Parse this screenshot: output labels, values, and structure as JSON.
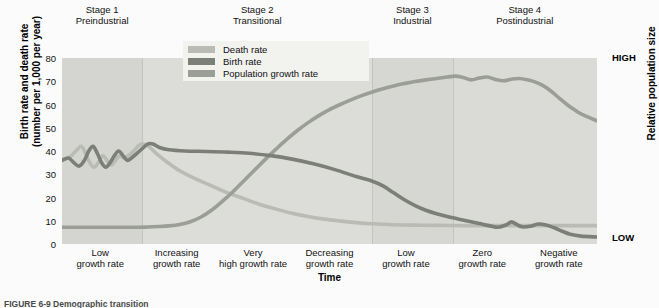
{
  "chart_data": {
    "type": "line",
    "xlabel": "Time",
    "ylabel_line1": "Birth rate and death rate",
    "ylabel_line2": "(number per 1,000 per year)",
    "right_axis_label": "Relative population size",
    "right_axis_high": "HIGH",
    "right_axis_low": "LOW",
    "ylim": [
      0,
      80
    ],
    "yticks": [
      80,
      70,
      60,
      50,
      40,
      30,
      20,
      10,
      0
    ],
    "grid": false,
    "legend_position": "top-center-inside",
    "legend": [
      {
        "name": "Death rate",
        "color": "#b9bbb4"
      },
      {
        "name": "Birth rate",
        "color": "#7c7f78"
      },
      {
        "name": "Population growth rate",
        "color": "#9b9e96"
      }
    ],
    "stages": [
      {
        "number": "Stage 1",
        "name": "Preindustrial",
        "x_start": 0,
        "x_end": 15
      },
      {
        "number": "Stage 2",
        "name": "Transitional",
        "x_start": 15,
        "x_end": 58
      },
      {
        "number": "Stage 3",
        "name": "Industrial",
        "x_start": 58,
        "x_end": 73
      },
      {
        "number": "Stage 4",
        "name": "Postindustrial",
        "x_start": 73,
        "x_end": 100
      }
    ],
    "growth_rate_labels": [
      "Low growth rate",
      "Increasing growth rate",
      "Very high growth rate",
      "Decreasing growth rate",
      "Low growth rate",
      "Zero growth rate",
      "Negative growth rate"
    ],
    "series": [
      {
        "name": "Death rate",
        "color": "#b9bbb4",
        "points": [
          [
            0,
            36
          ],
          [
            1.5,
            37.5
          ],
          [
            2.6,
            40
          ],
          [
            3.6,
            42
          ],
          [
            4.4,
            39
          ],
          [
            5.2,
            35
          ],
          [
            6.0,
            33
          ],
          [
            6.8,
            35
          ],
          [
            7.6,
            38
          ],
          [
            8.4,
            36
          ],
          [
            9.2,
            34
          ],
          [
            10.0,
            36
          ],
          [
            10.8,
            38
          ],
          [
            11.6,
            37
          ],
          [
            12.4,
            38
          ],
          [
            13.4,
            40
          ],
          [
            14.4,
            42.5
          ],
          [
            15.2,
            43
          ],
          [
            16.2,
            42
          ],
          [
            17.6,
            39
          ],
          [
            19.5,
            35.5
          ],
          [
            22,
            31.5
          ],
          [
            25,
            28
          ],
          [
            28,
            25
          ],
          [
            31,
            22
          ],
          [
            34,
            19.5
          ],
          [
            37,
            17
          ],
          [
            40,
            15
          ],
          [
            43,
            13.2
          ],
          [
            46,
            11.8
          ],
          [
            49,
            10.7
          ],
          [
            52,
            9.9
          ],
          [
            55,
            9.2
          ],
          [
            58,
            8.7
          ],
          [
            62,
            8.3
          ],
          [
            66,
            8.1
          ],
          [
            70,
            8.0
          ],
          [
            75,
            7.9
          ],
          [
            80,
            7.9
          ],
          [
            85,
            7.9
          ],
          [
            90,
            7.9
          ],
          [
            95,
            7.9
          ],
          [
            100,
            7.9
          ]
        ]
      },
      {
        "name": "Birth rate",
        "color": "#7c7f78",
        "points": [
          [
            0,
            36
          ],
          [
            1.2,
            37
          ],
          [
            2.2,
            35
          ],
          [
            3.2,
            33.5
          ],
          [
            4.2,
            36
          ],
          [
            5.0,
            40
          ],
          [
            5.8,
            42
          ],
          [
            6.6,
            39
          ],
          [
            7.4,
            35
          ],
          [
            8.2,
            33
          ],
          [
            9.0,
            35
          ],
          [
            9.8,
            38
          ],
          [
            10.6,
            40
          ],
          [
            11.4,
            38
          ],
          [
            12.2,
            36
          ],
          [
            13.0,
            37
          ],
          [
            14.0,
            39
          ],
          [
            15.0,
            41
          ],
          [
            16.0,
            43
          ],
          [
            17.0,
            43
          ],
          [
            18.2,
            41.5
          ],
          [
            20,
            40.5
          ],
          [
            23,
            40
          ],
          [
            27,
            39.8
          ],
          [
            31,
            39.5
          ],
          [
            35,
            39
          ],
          [
            39,
            38
          ],
          [
            43,
            36.5
          ],
          [
            47,
            34.5
          ],
          [
            51,
            32
          ],
          [
            55,
            29
          ],
          [
            58,
            27
          ],
          [
            60,
            25
          ],
          [
            62,
            22
          ],
          [
            64,
            19
          ],
          [
            66,
            16.5
          ],
          [
            68,
            14.5
          ],
          [
            70,
            13
          ],
          [
            72,
            11.8
          ],
          [
            74,
            10.8
          ],
          [
            76,
            9.8
          ],
          [
            78,
            8.8
          ],
          [
            80,
            7.8
          ],
          [
            81.5,
            7.2
          ],
          [
            83,
            8.2
          ],
          [
            84,
            9.5
          ],
          [
            85,
            8.4
          ],
          [
            86,
            7.4
          ],
          [
            87.5,
            7.6
          ],
          [
            89,
            8.6
          ],
          [
            90.5,
            8.2
          ],
          [
            92,
            7.0
          ],
          [
            93.5,
            5.5
          ],
          [
            95,
            4.2
          ],
          [
            97,
            3.4
          ],
          [
            100,
            3.0
          ]
        ]
      },
      {
        "name": "Population growth rate",
        "color": "#9b9e96",
        "points": [
          [
            0,
            7.2
          ],
          [
            5,
            7.2
          ],
          [
            10,
            7.2
          ],
          [
            14,
            7.2
          ],
          [
            16,
            7.3
          ],
          [
            18,
            7.5
          ],
          [
            20,
            7.8
          ],
          [
            22,
            8.4
          ],
          [
            24,
            9.6
          ],
          [
            26,
            11.6
          ],
          [
            28,
            14.6
          ],
          [
            30,
            18.4
          ],
          [
            32,
            22.6
          ],
          [
            34,
            27.2
          ],
          [
            36,
            31.8
          ],
          [
            38,
            36.4
          ],
          [
            40,
            40.8
          ],
          [
            42,
            45.0
          ],
          [
            44,
            48.8
          ],
          [
            46,
            52.2
          ],
          [
            48,
            55.2
          ],
          [
            50,
            57.8
          ],
          [
            52,
            60.0
          ],
          [
            54,
            62.0
          ],
          [
            56,
            63.8
          ],
          [
            58,
            65.4
          ],
          [
            60,
            66.8
          ],
          [
            62,
            68.0
          ],
          [
            64,
            69.0
          ],
          [
            66,
            69.9
          ],
          [
            68,
            70.6
          ],
          [
            70,
            71.2
          ],
          [
            72,
            71.8
          ],
          [
            73.5,
            72.2
          ],
          [
            75,
            71.6
          ],
          [
            76.5,
            70.6
          ],
          [
            78,
            71.4
          ],
          [
            79.5,
            71.8
          ],
          [
            81,
            70.8
          ],
          [
            82.5,
            70.2
          ],
          [
            84,
            70.9
          ],
          [
            85.5,
            71.2
          ],
          [
            87,
            70.6
          ],
          [
            88.5,
            69.6
          ],
          [
            90,
            68.0
          ],
          [
            91.5,
            65.6
          ],
          [
            93,
            62.6
          ],
          [
            94.5,
            59.8
          ],
          [
            96,
            57.4
          ],
          [
            97.5,
            55.4
          ],
          [
            100,
            53.0
          ]
        ]
      }
    ]
  },
  "caption": {
    "text": "FIGURE 6-9  Demographic transition"
  }
}
